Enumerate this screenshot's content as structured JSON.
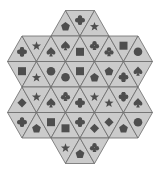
{
  "puzzle": {
    "type": "triangle-tile-matching",
    "colors": {
      "background": "#ffffff",
      "tile_fill": "#cbcbcb",
      "tile_edge": "#6a6a6a",
      "symbol": "#4e4e4e"
    },
    "rows": [
      {
        "top": [
          -0.5,
          0.5
        ],
        "bottom": [
          -1,
          1
        ],
        "first": "up",
        "symbols": [
          "pentagon",
          "cross",
          "star"
        ]
      },
      {
        "top": [
          -2,
          2
        ],
        "bottom": [
          -2.5,
          2.5
        ],
        "first": "up",
        "symbols": [
          "cross",
          "star",
          "spade",
          "spade",
          "square",
          "club",
          "club",
          "square",
          "circle"
        ]
      },
      {
        "top": [
          -2.5,
          2.5
        ],
        "bottom": [
          -2,
          2
        ],
        "first": "down",
        "symbols": [
          "square",
          "star",
          "circle",
          "circle",
          "square",
          "pentagon",
          "pentagon",
          "cross",
          "spade"
        ]
      },
      {
        "top": [
          -2,
          2
        ],
        "bottom": [
          -2.5,
          2.5
        ],
        "first": "up",
        "symbols": [
          "diamond",
          "star",
          "spade",
          "club",
          "cross",
          "star",
          "star",
          "cross",
          "spade"
        ]
      },
      {
        "top": [
          -2.5,
          2.5
        ],
        "bottom": [
          -2,
          2
        ],
        "first": "down",
        "symbols": [
          "cross",
          "pentagon",
          "square",
          "square",
          "cross",
          "diamond",
          "diamond",
          "pentagon",
          "circle"
        ]
      },
      {
        "top": [
          -1,
          1
        ],
        "bottom": [
          -0.5,
          0.5
        ],
        "first": "down",
        "symbols": [
          "star",
          "pentagon",
          "club"
        ]
      }
    ]
  }
}
